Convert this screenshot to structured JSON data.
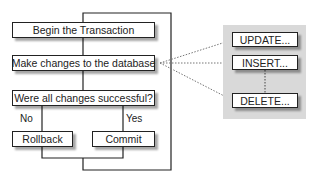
{
  "diagram": {
    "flow": {
      "begin": "Begin the Transaction",
      "make_changes": "Make changes to the database",
      "decision": "Were all changes successful?",
      "no_label": "No",
      "yes_label": "Yes",
      "rollback": "Rollback",
      "commit": "Commit"
    },
    "statements": {
      "update": "UPDATE...",
      "insert": "INSERT...",
      "delete": "DELETE..."
    },
    "colors": {
      "line": "#222222",
      "panel": "#d9d9d9",
      "dotted": "#777777"
    }
  }
}
